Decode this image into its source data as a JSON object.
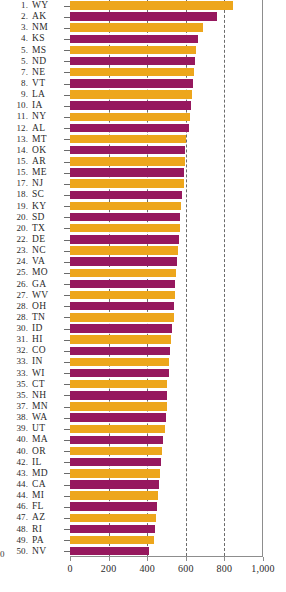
{
  "chart_data": {
    "type": "bar",
    "orientation": "horizontal",
    "title": "",
    "xlabel": "",
    "ylabel": "",
    "xlim": [
      0,
      1000
    ],
    "grid": true,
    "gridlines": [
      200,
      400,
      600,
      800
    ],
    "xticks": [
      0,
      200,
      400,
      600,
      800,
      1000
    ],
    "xtick_labels": [
      "0",
      "200",
      "400",
      "600",
      "800",
      "1,000"
    ],
    "legend": null,
    "colors": {
      "bar_odd": "#eda61c",
      "bar_even": "#96185e",
      "axis": "#8d8d8d",
      "gridline": "#6b6b6b",
      "text": "#2b2b2b"
    },
    "categories": [
      "WY",
      "AK",
      "NM",
      "KS",
      "MS",
      "ND",
      "NE",
      "VT",
      "LA",
      "IA",
      "NY",
      "AL",
      "MT",
      "OK",
      "AR",
      "ME",
      "NJ",
      "SC",
      "KY",
      "SD",
      "TX",
      "DE",
      "NC",
      "VA",
      "MO",
      "GA",
      "WV",
      "OH",
      "TN",
      "ID",
      "HI",
      "CO",
      "IN",
      "WI",
      "CT",
      "NH",
      "MN",
      "WA",
      "UT",
      "MA",
      "OR",
      "IL",
      "MD",
      "CA",
      "MI",
      "FL",
      "AZ",
      "RI",
      "PA",
      "NV"
    ],
    "ranks": [
      "1.",
      "2.",
      "3.",
      "4.",
      "5.",
      "5.",
      "7.",
      "8.",
      "9.",
      "10.",
      "11.",
      "12.",
      "13.",
      "14.",
      "15.",
      "15.",
      "17.",
      "18.",
      "19.",
      "20.",
      "20.",
      "22.",
      "23.",
      "24.",
      "25.",
      "26.",
      "27.",
      "28.",
      "28.",
      "30.",
      "31.",
      "32.",
      "33.",
      "33.",
      "35.",
      "35.",
      "37.",
      "38.",
      "39.",
      "40.",
      "40.",
      "42.",
      "43.",
      "44.",
      "44.",
      "46.",
      "47.",
      "48.",
      "49.",
      "50."
    ],
    "values": [
      845,
      760,
      690,
      665,
      655,
      650,
      640,
      635,
      630,
      625,
      620,
      615,
      600,
      597,
      595,
      592,
      590,
      580,
      575,
      570,
      568,
      565,
      560,
      555,
      550,
      545,
      543,
      540,
      538,
      530,
      525,
      520,
      515,
      513,
      505,
      503,
      500,
      495,
      490,
      480,
      478,
      470,
      465,
      460,
      458,
      450,
      445,
      440,
      435,
      410
    ]
  },
  "footer": {
    "origin_marker": "0"
  }
}
